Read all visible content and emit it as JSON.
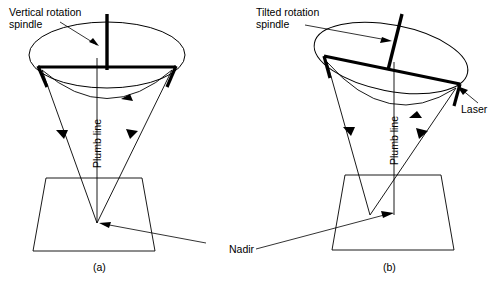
{
  "figure": {
    "type": "technical-line-diagram",
    "background_color": "#ffffff",
    "line_color": "#000000",
    "width": 502,
    "height": 285
  },
  "labels": {
    "vertical_spindle": "Vertical rotation\nspindle",
    "vertical_spindle_line1": "Vertical rotation",
    "vertical_spindle_line2": "spindle",
    "tilted_spindle_line1": "Tilted rotation",
    "tilted_spindle_line2": "spindle",
    "plumb_line_a": "Plumb line",
    "plumb_line_b": "Plumb line",
    "laser": "Laser",
    "nadir": "Nadir"
  },
  "captions": {
    "panel_a": "(a)",
    "panel_b": "(b)"
  },
  "panels": [
    {
      "id": "a",
      "caption": "(a)",
      "spindle_state": "vertical",
      "spindle_label": "Vertical rotation spindle",
      "beams_converge_on_plumb_line": true,
      "nadir_offset_px": 0
    },
    {
      "id": "b",
      "caption": "(b)",
      "spindle_state": "tilted",
      "spindle_label": "Tilted rotation spindle",
      "beams_converge_on_plumb_line": false,
      "nadir_offset_px": 25
    }
  ]
}
